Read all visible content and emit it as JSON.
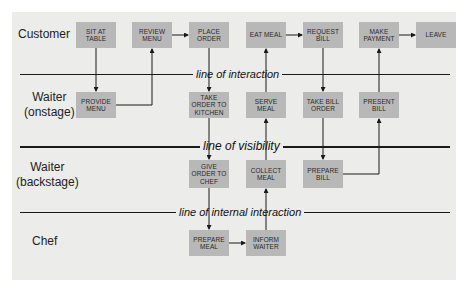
{
  "diagram": {
    "type": "service-blueprint",
    "lanes": [
      {
        "id": "customer",
        "label": "Customer"
      },
      {
        "id": "waiter_onstage",
        "label": "Waiter\n(onstage)"
      },
      {
        "id": "waiter_backstage",
        "label": "Waiter\n(backstage)"
      },
      {
        "id": "chef",
        "label": "Chef"
      }
    ],
    "separators": {
      "interaction": "line of interaction",
      "visibility": "line of visibility",
      "internal": "line of internal interaction"
    },
    "boxes": {
      "sit_at_table": "SIT AT\nTABLE",
      "review_menu": "REVIEW\nMENU",
      "place_order": "PLACE\nORDER",
      "eat_meal": "EAT MEAL",
      "request_bill": "REQUEST\nBILL",
      "make_payment": "MAKE\nPAYMENT",
      "leave": "LEAVE",
      "provide_menu": "PROVIDE\nMENU",
      "take_order_to_kitchen": "TAKE\nORDER TO\nKITCHEN",
      "serve_meal": "SERVE\nMEAL",
      "take_bill_order": "TAKE BILL\nORDER",
      "present_bill": "PRESENT\nBILL",
      "give_order_to_chef": "GIVE\nORDER TO\nCHEF",
      "collect_meal": "COLLECT\nMEAL",
      "prepare_bill": "PREPARE\nBILL",
      "prepare_meal": "PREPARE\nMEAL",
      "inform_waiter": "INFORM\nWAITER"
    },
    "edges": [
      [
        "sit_at_table",
        "provide_menu"
      ],
      [
        "provide_menu",
        "review_menu"
      ],
      [
        "review_menu",
        "place_order"
      ],
      [
        "place_order",
        "take_order_to_kitchen"
      ],
      [
        "take_order_to_kitchen",
        "give_order_to_chef"
      ],
      [
        "give_order_to_chef",
        "prepare_meal"
      ],
      [
        "prepare_meal",
        "inform_waiter"
      ],
      [
        "inform_waiter",
        "collect_meal"
      ],
      [
        "collect_meal",
        "serve_meal"
      ],
      [
        "serve_meal",
        "eat_meal"
      ],
      [
        "eat_meal",
        "request_bill"
      ],
      [
        "request_bill",
        "take_bill_order"
      ],
      [
        "take_bill_order",
        "prepare_bill"
      ],
      [
        "prepare_bill",
        "present_bill"
      ],
      [
        "present_bill",
        "make_payment"
      ],
      [
        "make_payment",
        "leave"
      ]
    ]
  }
}
